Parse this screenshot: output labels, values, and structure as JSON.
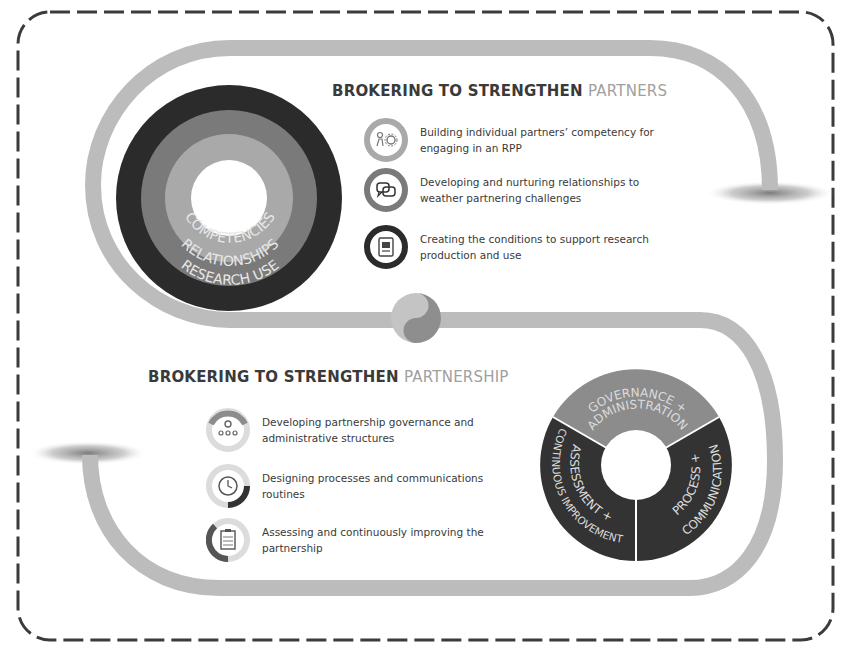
{
  "frame": {
    "border_color": "#3b3b3b",
    "border_style": "dashed-rounded"
  },
  "colors": {
    "track": "#b9b9b9",
    "track_dark": "#9a9a9a",
    "ring_dark": "#2b2b2b",
    "ring_mid": "#7a7a7a",
    "ring_light": "#a9a9a9",
    "text_dark": "#3a3a3a",
    "text_light": "#a0a0a0",
    "pie_light": "#8c8c8c",
    "pie_dark": "#333333"
  },
  "partners_section": {
    "heading_bold": "BROKERING TO STRENGTHEN ",
    "heading_light": "PARTNERS",
    "concentric_labels": {
      "inner": "COMPETENCIES",
      "middle": "RELATIONSHIPS",
      "outer": "RESEARCH USE"
    },
    "items": [
      {
        "icon": "people-gear-icon",
        "text": "Building individual partners’ competency for engaging in an RPP"
      },
      {
        "icon": "speech-bubbles-icon",
        "text": "Developing and nurturing relationships to weather partnering challenges"
      },
      {
        "icon": "document-presentation-icon",
        "text": "Creating the conditions to support research production and use"
      }
    ]
  },
  "partnership_section": {
    "heading_bold": "BROKERING TO STRENGTHEN ",
    "heading_light": "PARTNERSHIP",
    "pie_labels": {
      "top_line1": "GOVERNANCE +",
      "top_line2": "ADMINISTRATION",
      "right_line1": "PROCESS +",
      "right_line2": "COMMUNICATION",
      "left_line1": "ASSESSMENT +",
      "left_line2": "CONTINUOUS IMPROVEMENT"
    },
    "items": [
      {
        "icon": "governance-network-icon",
        "text": "Developing partnership governance and administrative structures"
      },
      {
        "icon": "clock-process-icon",
        "text": "Designing processes and communications routines"
      },
      {
        "icon": "clipboard-assessment-icon",
        "text": "Assessing and continuously improving the partnership"
      }
    ]
  }
}
